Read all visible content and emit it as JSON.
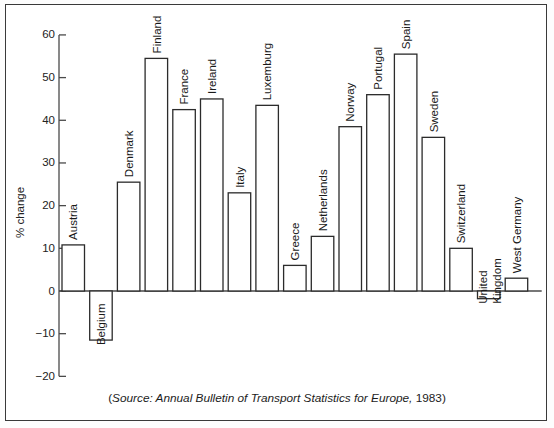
{
  "chart_data": {
    "type": "bar",
    "title": "",
    "subtitle": "",
    "xlabel": "",
    "ylabel": "% change",
    "ylim": [
      -20,
      60
    ],
    "yticks": [
      -20,
      -10,
      0,
      10,
      20,
      30,
      40,
      50,
      60
    ],
    "ytick_labels": [
      "−20",
      "−10",
      "0",
      "10",
      "20",
      "30",
      "40",
      "50",
      "60"
    ],
    "grid": false,
    "legend": null,
    "categories": [
      "Austria",
      "Belgium",
      "Denmark",
      "Finland",
      "France",
      "Ireland",
      "Italy",
      "Luxemburg",
      "Greece",
      "Netherlands",
      "Norway",
      "Portugal",
      "Spain",
      "Sweden",
      "Switzerland",
      "United Kingdom",
      "West Germany"
    ],
    "values": [
      10.8,
      -11.5,
      25.5,
      54.5,
      42.5,
      45.0,
      23.0,
      43.5,
      6.0,
      12.8,
      38.5,
      46.0,
      55.5,
      36.0,
      10.0,
      -1.8,
      3.0
    ],
    "bar_labels_rotated": true,
    "bar_label_orientation": "vertical-bottom-up",
    "bar_style": {
      "fill": "#ffffff",
      "stroke": "#2b2b2b"
    }
  },
  "caption": {
    "open_paren": "(",
    "source_text": "Source: Annual Bulletin of Transport Statistics for Europe,",
    "year": " 1983",
    "close_paren": ")"
  },
  "colors": {
    "frame": "#3a3a3a",
    "axis": "#4a4a4a",
    "bar_stroke": "#2b2b2b",
    "background": "#ffffff",
    "text": "#1a1a1a"
  }
}
